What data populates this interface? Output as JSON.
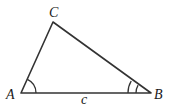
{
  "diagram": {
    "type": "triangle",
    "vertices": {
      "A": {
        "label": "A"
      },
      "B": {
        "label": "B"
      },
      "C": {
        "label": "C"
      }
    },
    "side_labels": {
      "c": "c"
    },
    "angle_marks": {
      "A": "single arc",
      "B": "double arc"
    },
    "colors": {
      "stroke": "#333333",
      "label": "#1a1a1a",
      "background": "#ffffff"
    }
  }
}
